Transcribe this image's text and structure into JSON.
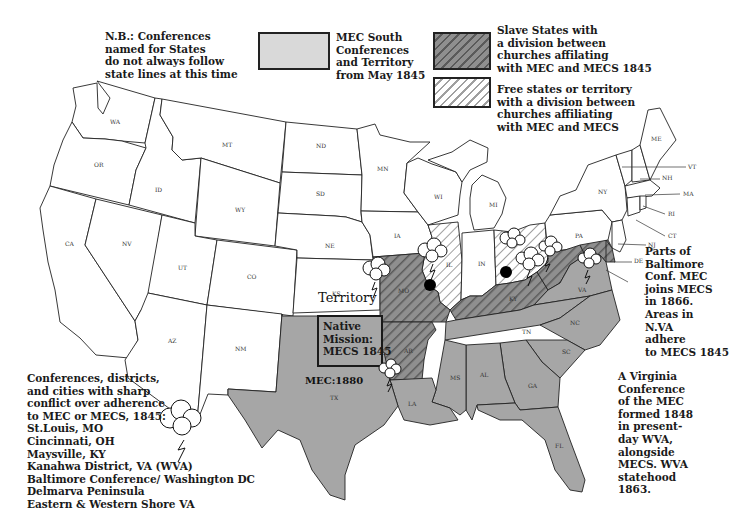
{
  "colors": {
    "south": "#a6a6a6",
    "slave_divided_fill": "#8f8f8f",
    "slave_divided_hatch": "#555555",
    "free_divided_hatch": "#9a9a9a",
    "free": "#ffffff",
    "border": "#222222"
  },
  "notes": {
    "nb": "N.B.: Conferences\nnamed for States\ndo not always follow\nstate lines at this time",
    "baltimore": "Parts of\nBaltimore\nConf. MEC\njoins MECS\nin 1866.\nAreas in\nN.VA\nadhere\nto MECS 1845",
    "virginia": "A Virginia\nConference\nof the MEC\nformed 1848\nin present-\nday WVA,\nalongside\nMECS. WVA\nstatehood\n1863.",
    "conflict": "Conferences, districts,\nand cities with sharp\nconflict over adherence\nto MEC or MECS, 1845:\nSt.Louis, MO\nCincinnati, OH\nMaysville, KY\nKanahwa District, VA (WVA)\nBaltimore Conference/ Washington DC\nDelmarva Peninsula\nEastern & Western Shore VA"
  },
  "legend": [
    {
      "key": "mecs",
      "label": "MEC South\nConferences\nand Territory\nfrom May 1845"
    },
    {
      "key": "slave_divided",
      "label": "Slave States with\na division between\n churches affilating\nwith MEC and MECS 1845"
    },
    {
      "key": "free_divided",
      "label": "Free states or territory\nwith a division between\nchurches affiliating\nwith MEC and MECS"
    }
  ],
  "map_labels": {
    "territory": "Territory",
    "native_mission": "Native\nMission:\nMECS 1845",
    "mec_1880": "MEC:1880"
  },
  "states": {
    "WA": "WA",
    "OR": "OR",
    "CA": "CA",
    "ID": "ID",
    "NV": "NV",
    "MT": "MT",
    "WY": "WY",
    "UT": "UT",
    "AZ": "AZ",
    "CO": "CO",
    "NM": "NM",
    "ND": "ND",
    "SD": "SD",
    "NE": "NE",
    "KS": "KS",
    "MN": "MN",
    "IA": "IA",
    "MO": "MO",
    "WI": "WI",
    "IL": "IL",
    "MI": "MI",
    "IN": "IN",
    "OH": "OH",
    "KY": "KY",
    "TN": "TN",
    "AR": "AR",
    "LA": "LA",
    "MS": "MS",
    "AL": "AL",
    "GA": "GA",
    "FL": "FL",
    "SC": "SC",
    "NC": "NC",
    "VA": "VA",
    "WV": "WV",
    "PA": "PA",
    "NY": "NY",
    "VT": "VT",
    "NH": "NH",
    "ME": "ME",
    "MA": "MA",
    "RI": "RI",
    "CT": "CT",
    "NJ": "NJ",
    "DE": "DE",
    "MD": "MD",
    "TX": "TX"
  },
  "conflict_sites": [
    {
      "name": "St.Louis, MO"
    },
    {
      "name": "Cincinnati, OH"
    },
    {
      "name": "Maysville, KY"
    },
    {
      "name": "Kanahwa District, VA (WVA)"
    },
    {
      "name": "Baltimore Conference/ Washington DC"
    },
    {
      "name": "Delmarva Peninsula"
    },
    {
      "name": "Eastern & Western Shore VA"
    }
  ]
}
